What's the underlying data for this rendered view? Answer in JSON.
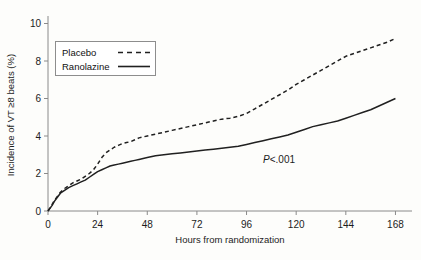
{
  "chart_data": {
    "type": "line",
    "title": "",
    "xlabel": "Hours from randomization",
    "ylabel": "Incidence of VT ≥8 beats (%)",
    "xlim": [
      0,
      176
    ],
    "ylim": [
      0,
      10.4
    ],
    "xticks": [
      0,
      24,
      48,
      72,
      96,
      120,
      144,
      168
    ],
    "xtick_labels": [
      "0",
      "24",
      "48",
      "72",
      "96",
      "120",
      "144",
      "168"
    ],
    "yticks": [
      0,
      2,
      4,
      6,
      8,
      10
    ],
    "ytick_labels": [
      "0",
      "2",
      "4",
      "6",
      "8",
      "10"
    ],
    "grid": false,
    "legend_position": "upper-left-inset",
    "annotations": [
      {
        "text_italic": "P",
        "text": "<.001",
        "x": 104,
        "y": 2.55
      }
    ],
    "series": [
      {
        "name": "Placebo",
        "style": "dashed",
        "color": "#202020",
        "x": [
          0,
          2,
          3,
          4,
          5,
          6,
          8,
          10,
          12,
          14,
          16,
          18,
          20,
          22,
          24,
          26,
          28,
          30,
          32,
          34,
          36,
          38,
          40,
          42,
          44,
          46,
          48,
          52,
          56,
          60,
          64,
          68,
          72,
          76,
          80,
          84,
          88,
          92,
          96,
          100,
          104,
          108,
          112,
          116,
          120,
          124,
          128,
          132,
          136,
          140,
          144,
          148,
          152,
          156,
          160,
          164,
          168
        ],
        "y": [
          0.0,
          0.35,
          0.55,
          0.7,
          0.85,
          1.0,
          1.2,
          1.35,
          1.5,
          1.6,
          1.7,
          1.85,
          2.0,
          2.2,
          2.5,
          2.85,
          3.1,
          3.25,
          3.4,
          3.5,
          3.6,
          3.65,
          3.7,
          3.8,
          3.9,
          3.95,
          4.0,
          4.1,
          4.2,
          4.3,
          4.4,
          4.5,
          4.6,
          4.7,
          4.8,
          4.9,
          4.95,
          5.05,
          5.2,
          5.45,
          5.7,
          5.95,
          6.2,
          6.45,
          6.75,
          7.0,
          7.25,
          7.5,
          7.75,
          8.0,
          8.25,
          8.4,
          8.55,
          8.7,
          8.85,
          9.0,
          9.2
        ]
      },
      {
        "name": "Ranolazine",
        "style": "solid",
        "color": "#202020",
        "x": [
          0,
          2,
          3,
          4,
          5,
          6,
          8,
          10,
          12,
          14,
          16,
          18,
          20,
          22,
          24,
          26,
          28,
          30,
          32,
          34,
          36,
          38,
          40,
          42,
          44,
          46,
          48,
          52,
          56,
          60,
          64,
          68,
          72,
          76,
          80,
          84,
          88,
          92,
          96,
          100,
          104,
          108,
          112,
          116,
          120,
          124,
          128,
          132,
          136,
          140,
          144,
          148,
          152,
          156,
          160,
          164,
          168
        ],
        "y": [
          0.0,
          0.3,
          0.5,
          0.65,
          0.8,
          0.95,
          1.1,
          1.25,
          1.35,
          1.45,
          1.55,
          1.65,
          1.8,
          1.95,
          2.1,
          2.2,
          2.3,
          2.4,
          2.45,
          2.5,
          2.55,
          2.6,
          2.65,
          2.7,
          2.75,
          2.8,
          2.85,
          2.95,
          3.0,
          3.05,
          3.1,
          3.15,
          3.2,
          3.25,
          3.3,
          3.35,
          3.4,
          3.45,
          3.55,
          3.65,
          3.75,
          3.85,
          3.95,
          4.05,
          4.2,
          4.35,
          4.5,
          4.6,
          4.7,
          4.8,
          4.95,
          5.1,
          5.25,
          5.4,
          5.6,
          5.8,
          6.0
        ]
      }
    ]
  },
  "legend": {
    "entries": [
      {
        "label": "Placebo",
        "style": "dashed"
      },
      {
        "label": "Ranolazine",
        "style": "solid"
      }
    ]
  }
}
